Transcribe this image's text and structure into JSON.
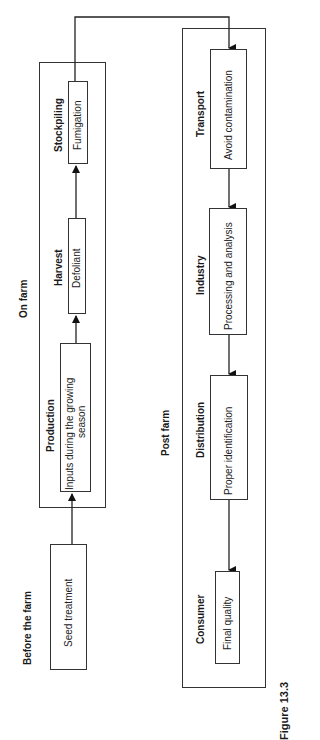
{
  "diagram": {
    "sections": {
      "before_farm": {
        "title": "Before the farm"
      },
      "on_farm": {
        "title": "On farm"
      },
      "post_farm": {
        "title": "Post farm"
      }
    },
    "stages": [
      {
        "id": "seed",
        "section": "before_farm",
        "stage": "",
        "content": "Seed treatment"
      },
      {
        "id": "production",
        "section": "on_farm",
        "stage": "Production",
        "content_line1": "Inputs during the growing",
        "content_line2": "season"
      },
      {
        "id": "harvest",
        "section": "on_farm",
        "stage": "Harvest",
        "content": "Defoliant"
      },
      {
        "id": "stockpiling",
        "section": "on_farm",
        "stage": "Stockpiling",
        "content": "Fumigation"
      },
      {
        "id": "transport",
        "section": "post_farm",
        "stage": "Transport",
        "content": "Avoid contamination"
      },
      {
        "id": "industry",
        "section": "post_farm",
        "stage": "Industry",
        "content": "Processing and analysis"
      },
      {
        "id": "distribution",
        "section": "post_farm",
        "stage": "Distribution",
        "content": "Proper identification"
      },
      {
        "id": "consumer",
        "section": "post_farm",
        "stage": "Consumer",
        "content": "Final quality"
      }
    ],
    "flow": [
      "seed",
      "production",
      "harvest",
      "stockpiling",
      "transport",
      "industry",
      "distribution",
      "consumer"
    ],
    "caption": "Figure 13.3",
    "colors": {
      "line": "#333333",
      "background": "#ffffff"
    }
  }
}
